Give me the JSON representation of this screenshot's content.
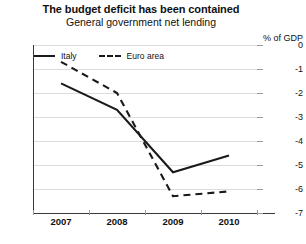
{
  "header": {
    "title": "The budget deficit has been contained",
    "subtitle": "General government net lending"
  },
  "axis": {
    "unit_label": "% of GDP",
    "y_ticks": [
      "0",
      "-1",
      "-2",
      "-3",
      "-4",
      "-5",
      "-6",
      "-7"
    ],
    "x_ticks": [
      "2007",
      "2008",
      "2009",
      "2010"
    ]
  },
  "legend": {
    "items": [
      {
        "label": "Italy",
        "style": "solid"
      },
      {
        "label": "Euro area",
        "style": "dashed"
      }
    ]
  },
  "chart_data": {
    "type": "line",
    "title": "The budget deficit has been contained",
    "subtitle": "General government net lending",
    "xlabel": "",
    "ylabel": "% of GDP",
    "x": [
      "2007",
      "2008",
      "2009",
      "2010"
    ],
    "categories": [
      "2007",
      "2008",
      "2009",
      "2010"
    ],
    "ylim": [
      -7,
      0
    ],
    "yticks": [
      0,
      -1,
      -2,
      -3,
      -4,
      -5,
      -6,
      -7
    ],
    "grid": true,
    "legend_position": "top-left",
    "series": [
      {
        "name": "Italy",
        "style": "solid",
        "color": "#1a1a1a",
        "values": [
          -1.6,
          -2.7,
          -5.3,
          -4.6
        ]
      },
      {
        "name": "Euro area",
        "style": "dashed",
        "color": "#1a1a1a",
        "values": [
          -0.7,
          -2.0,
          -6.3,
          -6.1
        ]
      }
    ]
  }
}
